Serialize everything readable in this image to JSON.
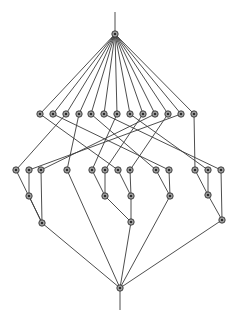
{
  "diagram": {
    "type": "hasse-diagram",
    "colors": {
      "edge": "#3a3a3a",
      "node_fill": "#9a9a9a",
      "node_stroke": "#2a2a2a",
      "node_center": "#111111",
      "background": "#ffffff"
    },
    "stems": [
      {
        "id": "top-stem",
        "x1": 115,
        "y1": 12,
        "x2": 115,
        "y2": 33
      },
      {
        "id": "bottom-stem",
        "x1": 120,
        "y1": 290,
        "x2": 120,
        "y2": 310
      }
    ],
    "nodes": [
      {
        "id": "top",
        "x": 115,
        "y": 34
      },
      {
        "id": "a1",
        "x": 40,
        "y": 114
      },
      {
        "id": "a2",
        "x": 53,
        "y": 114
      },
      {
        "id": "a3",
        "x": 66,
        "y": 114
      },
      {
        "id": "a4",
        "x": 79,
        "y": 114
      },
      {
        "id": "a5",
        "x": 91,
        "y": 114
      },
      {
        "id": "a6",
        "x": 104,
        "y": 114
      },
      {
        "id": "a7",
        "x": 117,
        "y": 114
      },
      {
        "id": "a8",
        "x": 130,
        "y": 114
      },
      {
        "id": "a9",
        "x": 143,
        "y": 114
      },
      {
        "id": "a10",
        "x": 155,
        "y": 114
      },
      {
        "id": "a11",
        "x": 168,
        "y": 114
      },
      {
        "id": "a12",
        "x": 181,
        "y": 114
      },
      {
        "id": "a13",
        "x": 194,
        "y": 114
      },
      {
        "id": "b1",
        "x": 16,
        "y": 170
      },
      {
        "id": "b2",
        "x": 29,
        "y": 170
      },
      {
        "id": "b3",
        "x": 41,
        "y": 170
      },
      {
        "id": "b4",
        "x": 67,
        "y": 170
      },
      {
        "id": "b5",
        "x": 92,
        "y": 170
      },
      {
        "id": "b6",
        "x": 105,
        "y": 170
      },
      {
        "id": "b7",
        "x": 118,
        "y": 170
      },
      {
        "id": "b8",
        "x": 130,
        "y": 170
      },
      {
        "id": "b9",
        "x": 156,
        "y": 170
      },
      {
        "id": "b10",
        "x": 169,
        "y": 170
      },
      {
        "id": "b11",
        "x": 195,
        "y": 170
      },
      {
        "id": "b12",
        "x": 208,
        "y": 170
      },
      {
        "id": "b13",
        "x": 221,
        "y": 170
      },
      {
        "id": "c1",
        "x": 29,
        "y": 196
      },
      {
        "id": "c2",
        "x": 105,
        "y": 196
      },
      {
        "id": "c3",
        "x": 131,
        "y": 196
      },
      {
        "id": "c4",
        "x": 170,
        "y": 196
      },
      {
        "id": "c5",
        "x": 208,
        "y": 195
      },
      {
        "id": "d1",
        "x": 42,
        "y": 223
      },
      {
        "id": "d2",
        "x": 131,
        "y": 222
      },
      {
        "id": "d3",
        "x": 222,
        "y": 220
      },
      {
        "id": "bottom",
        "x": 120,
        "y": 288
      }
    ],
    "edges": [
      [
        "top",
        "a1"
      ],
      [
        "top",
        "a2"
      ],
      [
        "top",
        "a3"
      ],
      [
        "top",
        "a4"
      ],
      [
        "top",
        "a5"
      ],
      [
        "top",
        "a6"
      ],
      [
        "top",
        "a7"
      ],
      [
        "top",
        "a8"
      ],
      [
        "top",
        "a9"
      ],
      [
        "top",
        "a10"
      ],
      [
        "top",
        "a11"
      ],
      [
        "top",
        "a12"
      ],
      [
        "top",
        "a13"
      ],
      [
        "a1",
        "b7"
      ],
      [
        "a2",
        "b10"
      ],
      [
        "a3",
        "b1"
      ],
      [
        "a4",
        "b4"
      ],
      [
        "a5",
        "b9"
      ],
      [
        "a6",
        "b13"
      ],
      [
        "a7",
        "b5"
      ],
      [
        "a8",
        "b12"
      ],
      [
        "a9",
        "b6"
      ],
      [
        "a10",
        "b3"
      ],
      [
        "a11",
        "b8"
      ],
      [
        "a12",
        "b2"
      ],
      [
        "a13",
        "b11"
      ],
      [
        "b1",
        "d1"
      ],
      [
        "b2",
        "c1"
      ],
      [
        "b3",
        "d1"
      ],
      [
        "c1",
        "d1"
      ],
      [
        "b4",
        "bottom"
      ],
      [
        "b5",
        "c2"
      ],
      [
        "b6",
        "c2"
      ],
      [
        "b7",
        "c3"
      ],
      [
        "b8",
        "c3"
      ],
      [
        "c2",
        "d2"
      ],
      [
        "c3",
        "d2"
      ],
      [
        "b9",
        "c4"
      ],
      [
        "b10",
        "c4"
      ],
      [
        "b11",
        "c5"
      ],
      [
        "b12",
        "c5"
      ],
      [
        "b13",
        "d3"
      ],
      [
        "c5",
        "d3"
      ],
      [
        "d1",
        "bottom"
      ],
      [
        "d2",
        "bottom"
      ],
      [
        "c4",
        "bottom"
      ],
      [
        "d3",
        "bottom"
      ]
    ]
  }
}
